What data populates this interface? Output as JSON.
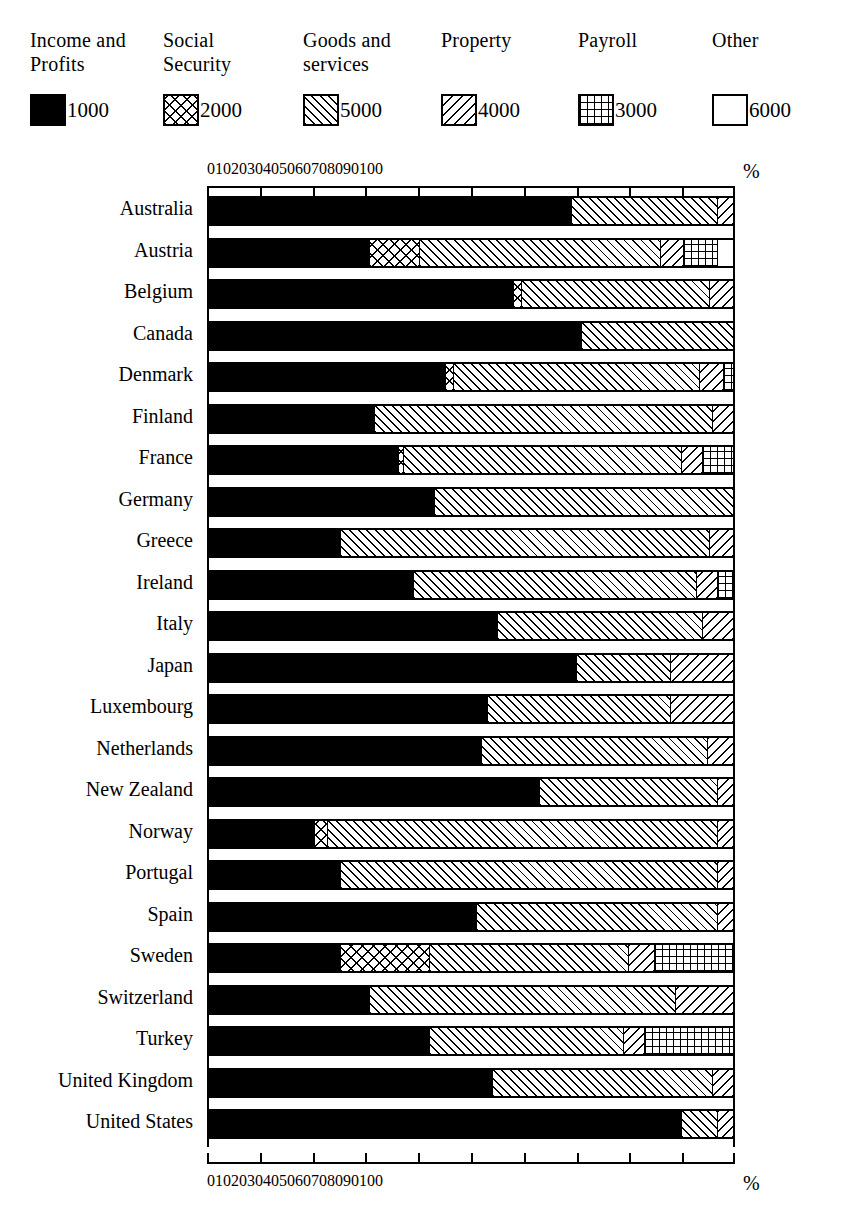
{
  "legend": {
    "items": [
      {
        "title": "Income and\nProfits",
        "code": "1000",
        "pattern": "solid-black",
        "name": "income-and-profits"
      },
      {
        "title": "Social\nSecurity",
        "code": "2000",
        "pattern": "cross-hatch",
        "name": "social-security"
      },
      {
        "title": "Goods and\nservices",
        "code": "5000",
        "pattern": "diagonal-left",
        "name": "goods-and-services"
      },
      {
        "title": "Property",
        "code": "4000",
        "pattern": "diagonal-right",
        "name": "property"
      },
      {
        "title": "Payroll",
        "code": "3000",
        "pattern": "grid",
        "name": "payroll"
      },
      {
        "title": "Other",
        "code": "6000",
        "pattern": "white",
        "name": "other"
      }
    ]
  },
  "axis": {
    "ticks": [
      "0",
      "10",
      "20",
      "30",
      "40",
      "50",
      "60",
      "70",
      "80",
      "90",
      "100"
    ],
    "unit": "%"
  },
  "chart_data": {
    "type": "bar",
    "orientation": "horizontal",
    "stacked": true,
    "normalized": true,
    "title": "",
    "xlabel": "%",
    "ylabel": "",
    "xlim": [
      0,
      100
    ],
    "grid": false,
    "legend_position": "top",
    "series": [
      {
        "name": "Income and Profits",
        "code": "1000",
        "pattern": "solid-black",
        "values": [
          69.0,
          30.5,
          58.0,
          71.0,
          45.0,
          31.5,
          36.0,
          43.0,
          25.0,
          39.0,
          55.0,
          70.0,
          53.0,
          52.0,
          63.0,
          20.0,
          25.0,
          51.0,
          25.0,
          30.5,
          42.0,
          54.0,
          90.0
        ]
      },
      {
        "name": "Social Security",
        "code": "2000",
        "pattern": "cross-hatch",
        "values": [
          0.0,
          9.5,
          1.5,
          0.0,
          1.5,
          0.0,
          1.0,
          0.0,
          0.0,
          0.0,
          0.0,
          0.0,
          0.0,
          0.0,
          0.0,
          2.5,
          0.0,
          0.0,
          17.0,
          0.0,
          0.0,
          0.0,
          0.0
        ]
      },
      {
        "name": "Goods and services",
        "code": "5000",
        "pattern": "diagonal-left",
        "values": [
          28.0,
          46.0,
          36.0,
          29.0,
          47.0,
          64.5,
          53.0,
          57.0,
          70.5,
          54.0,
          39.0,
          18.0,
          35.0,
          43.0,
          34.0,
          74.5,
          72.0,
          46.0,
          38.0,
          58.5,
          37.0,
          42.0,
          7.0
        ]
      },
      {
        "name": "Property",
        "code": "4000",
        "pattern": "diagonal-right",
        "values": [
          3.0,
          4.5,
          4.5,
          0.0,
          4.5,
          4.0,
          4.0,
          0.0,
          4.5,
          4.0,
          6.0,
          12.0,
          12.0,
          5.0,
          3.0,
          3.0,
          3.0,
          3.0,
          5.0,
          11.0,
          4.0,
          4.0,
          3.0
        ]
      },
      {
        "name": "Payroll",
        "code": "3000",
        "pattern": "grid",
        "values": [
          0.0,
          6.5,
          0.0,
          0.0,
          2.0,
          0.0,
          6.0,
          0.0,
          0.0,
          3.0,
          0.0,
          0.0,
          0.0,
          0.0,
          0.0,
          0.0,
          0.0,
          0.0,
          15.0,
          0.0,
          17.0,
          0.0,
          0.0
        ]
      },
      {
        "name": "Other",
        "code": "6000",
        "pattern": "white",
        "values": [
          0.0,
          3.0,
          0.0,
          0.0,
          0.0,
          0.0,
          0.0,
          0.0,
          0.0,
          0.0,
          0.0,
          0.0,
          0.0,
          0.0,
          0.0,
          0.0,
          0.0,
          0.0,
          0.0,
          0.0,
          0.0,
          0.0,
          0.0
        ]
      }
    ],
    "categories": [
      "Australia",
      "Austria",
      "Belgium",
      "Canada",
      "Denmark",
      "Finland",
      "France",
      "Germany",
      "Greece",
      "Ireland",
      "Italy",
      "Japan",
      "Luxembourg",
      "Netherlands",
      "New Zealand",
      "Norway",
      "Portugal",
      "Spain",
      "Sweden",
      "Switzerland",
      "Turkey",
      "United Kingdom",
      "United States"
    ]
  }
}
